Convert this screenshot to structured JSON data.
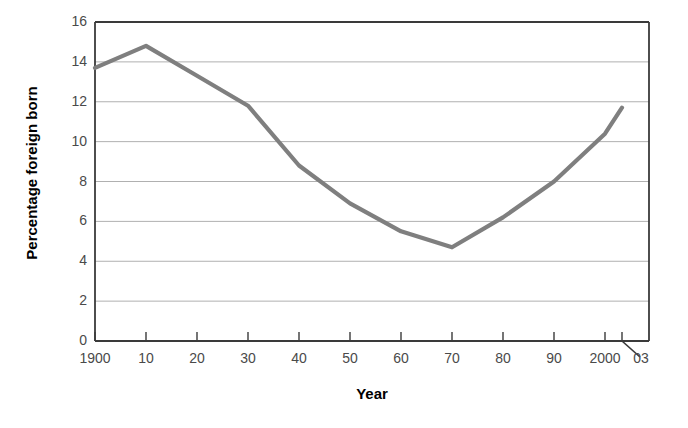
{
  "chart_data": {
    "type": "line",
    "title": "",
    "xlabel": "Year",
    "ylabel": "Percentage foreign born",
    "xlim": [
      1900,
      2003
    ],
    "ylim": [
      0,
      16
    ],
    "grid": true,
    "legend": null,
    "line_color": "#7f7f7f",
    "axis_color": "#3a3a3a",
    "grid_color": "#b0b0b0",
    "tick_label_color": "#4a4a4a",
    "x": [
      1900,
      1910,
      1920,
      1930,
      1940,
      1950,
      1960,
      1970,
      1980,
      1990,
      2000,
      2003
    ],
    "values": [
      13.7,
      14.8,
      13.3,
      11.8,
      8.8,
      6.9,
      5.5,
      4.7,
      6.2,
      8.0,
      10.4,
      11.7
    ],
    "xticks": [
      1900,
      1910,
      1920,
      1930,
      1940,
      1950,
      1960,
      1970,
      1980,
      1990,
      2000,
      2003
    ],
    "xticklabels": [
      "1900",
      "10",
      "20",
      "30",
      "40",
      "50",
      "60",
      "70",
      "80",
      "90",
      "2000",
      "03"
    ],
    "yticks": [
      0,
      2,
      4,
      6,
      8,
      10,
      12,
      14,
      16
    ],
    "yticklabels": [
      "0",
      "2",
      "4",
      "6",
      "8",
      "10",
      "12",
      "14",
      "16"
    ],
    "annotations": [
      {
        "text": "03",
        "leader_line": true,
        "note": "leader line from the 03 label up to the final tick on the axis"
      }
    ]
  }
}
